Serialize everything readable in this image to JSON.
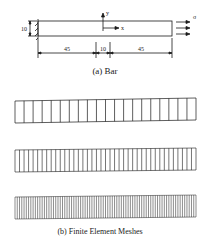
{
  "figure_a": {
    "caption": "(a) Bar",
    "height_label": "10",
    "axis_x_label": "x",
    "axis_y_label": "y",
    "load_label": "σ",
    "dimensions": [
      "45",
      "10",
      "45"
    ]
  },
  "figure_b": {
    "caption": "(b) Finite Element Meshes",
    "meshes": [
      {
        "name": "coarse",
        "elements": 20
      },
      {
        "name": "medium",
        "elements": 40
      },
      {
        "name": "fine",
        "elements": 80
      }
    ]
  },
  "colors": {
    "line": "#1a1a1a",
    "background": "#ffffff"
  }
}
